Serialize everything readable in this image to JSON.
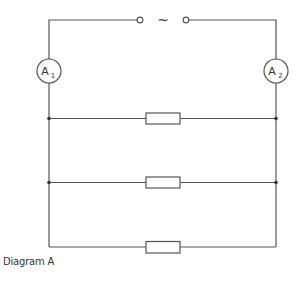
{
  "diagram": {
    "caption": "Diagram A",
    "source_symbol": "~",
    "ammeters": [
      {
        "id": "A1",
        "letter": "A",
        "subscript": "1"
      },
      {
        "id": "A2",
        "letter": "A",
        "subscript": "2"
      }
    ],
    "resistors": [
      {
        "id": "R1"
      },
      {
        "id": "R2"
      },
      {
        "id": "R3"
      }
    ],
    "colors": {
      "wire": "#555555",
      "text": "#333333",
      "background": "#ffffff"
    }
  }
}
